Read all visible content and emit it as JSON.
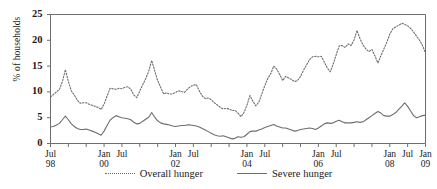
{
  "figure": {
    "clipped_header_text": "",
    "background": "#ffffff",
    "ink": "#6e6e6e"
  },
  "axes": {
    "y_label": "% of households",
    "y_ticks": [
      "0",
      "5",
      "10",
      "15",
      "20",
      "25"
    ],
    "x_ticks": [
      {
        "month": "Jul",
        "year": "98"
      },
      {
        "month": "Jan",
        "year": "00"
      },
      {
        "month": "Jul",
        "year": ""
      },
      {
        "month": "Jan",
        "year": "02"
      },
      {
        "month": "Jul",
        "year": ""
      },
      {
        "month": "Jan",
        "year": "04"
      },
      {
        "month": "Jul",
        "year": ""
      },
      {
        "month": "Jan",
        "year": "06"
      },
      {
        "month": "Jul",
        "year": ""
      },
      {
        "month": "Jan",
        "year": "08"
      },
      {
        "month": "Jul",
        "year": ""
      },
      {
        "month": "Jan",
        "year": "09"
      }
    ]
  },
  "legend": {
    "position": "bottom-center",
    "entries": [
      {
        "label": "Overall hunger",
        "style": "dotted",
        "color": "#6e6e6e"
      },
      {
        "label": "Severe hunger",
        "style": "solid",
        "color": "#6e6e6e"
      }
    ]
  },
  "chart_data": {
    "type": "line",
    "title": "",
    "subtitle": "",
    "xlabel": "",
    "ylabel": "% of households",
    "xlim": [
      0,
      127
    ],
    "ylim": [
      0,
      25
    ],
    "grid": false,
    "legend_position": "bottom-center",
    "x_tick_indices": [
      0,
      18,
      24,
      42,
      48,
      66,
      72,
      90,
      96,
      114,
      120,
      126
    ],
    "x_tick_labels": [
      "Jul 98",
      "Jan 00",
      "Jul",
      "Jan 02",
      "Jul",
      "Jan 04",
      "Jul",
      "Jan 06",
      "Jul",
      "Jan 08",
      "Jul",
      "Jan 09"
    ],
    "x_start": "Jul 1998",
    "x_end": "Jan 2009",
    "x_step": "monthly",
    "series": [
      {
        "name": "Overall hunger",
        "style": "dotted",
        "color": "#6e6e6e",
        "values": [
          9.0,
          9.5,
          10.0,
          10.5,
          12.0,
          14.3,
          12.0,
          10.2,
          9.4,
          8.4,
          7.8,
          7.9,
          7.9,
          7.6,
          7.4,
          7.2,
          7.0,
          6.6,
          7.6,
          9.2,
          10.7,
          10.6,
          10.5,
          10.7,
          10.6,
          10.9,
          11.0,
          10.5,
          9.4,
          8.9,
          10.2,
          11.4,
          12.6,
          14.0,
          16.1,
          14.1,
          12.2,
          10.9,
          9.6,
          9.8,
          9.6,
          9.6,
          9.9,
          10.2,
          10.1,
          9.9,
          10.5,
          11.0,
          11.3,
          11.4,
          10.2,
          9.2,
          8.7,
          8.8,
          8.5,
          7.9,
          7.5,
          7.0,
          6.7,
          6.8,
          6.7,
          6.4,
          6.4,
          5.9,
          5.2,
          6.0,
          7.4,
          9.3,
          8.2,
          7.3,
          8.0,
          9.6,
          11.2,
          12.6,
          13.5,
          15.0,
          14.4,
          13.4,
          12.2,
          13.0,
          12.7,
          12.4,
          12.0,
          12.2,
          13.0,
          14.2,
          15.2,
          16.2,
          16.8,
          16.9,
          16.8,
          16.9,
          15.8,
          14.6,
          13.9,
          15.4,
          17.2,
          18.9,
          19.0,
          18.6,
          19.3,
          19.0,
          20.1,
          21.9,
          20.3,
          19.1,
          18.3,
          17.8,
          18.2,
          17.0,
          15.6,
          17.0,
          18.3,
          19.6,
          21.2,
          22.2,
          22.6,
          22.9,
          23.3,
          23.1,
          22.8,
          22.3,
          21.6,
          20.8,
          20.0,
          19.0,
          17.5
        ]
      },
      {
        "name": "Severe hunger",
        "style": "solid",
        "color": "#6e6e6e",
        "values": [
          3.2,
          3.3,
          3.6,
          3.9,
          4.6,
          5.3,
          4.6,
          3.8,
          3.3,
          2.9,
          2.7,
          2.7,
          2.8,
          2.6,
          2.4,
          2.2,
          1.9,
          1.6,
          2.4,
          3.5,
          4.5,
          5.0,
          5.4,
          5.2,
          5.0,
          4.9,
          4.8,
          4.6,
          4.1,
          3.8,
          3.9,
          4.3,
          4.7,
          5.1,
          6.0,
          5.1,
          4.4,
          4.0,
          3.8,
          3.7,
          3.6,
          3.4,
          3.3,
          3.4,
          3.5,
          3.5,
          3.6,
          3.6,
          3.5,
          3.4,
          3.2,
          2.9,
          2.6,
          2.3,
          2.0,
          1.7,
          1.5,
          1.4,
          1.5,
          1.3,
          1.1,
          0.9,
          1.0,
          1.3,
          1.2,
          1.3,
          1.8,
          2.3,
          2.4,
          2.4,
          2.6,
          2.8,
          3.1,
          3.3,
          3.5,
          3.7,
          3.4,
          3.2,
          3.0,
          3.0,
          2.8,
          2.6,
          2.4,
          2.5,
          2.7,
          2.8,
          2.9,
          3.0,
          2.9,
          2.7,
          3.0,
          3.4,
          3.8,
          4.0,
          3.9,
          4.0,
          4.3,
          4.5,
          4.2,
          4.0,
          4.0,
          4.0,
          4.1,
          4.2,
          4.1,
          4.2,
          4.6,
          5.0,
          5.4,
          5.8,
          6.2,
          5.9,
          5.4,
          5.3,
          5.3,
          5.6,
          6.0,
          6.6,
          7.2,
          7.9,
          7.2,
          6.3,
          5.4,
          5.0,
          5.2,
          5.4,
          5.5
        ]
      }
    ]
  }
}
